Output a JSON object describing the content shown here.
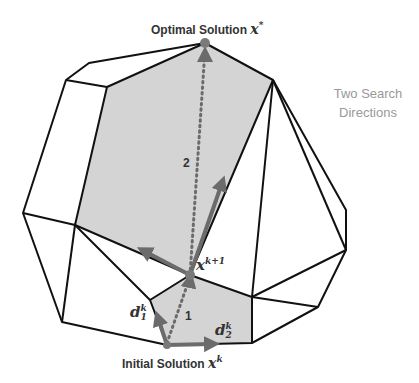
{
  "labels": {
    "optimal": "Optimal Solution",
    "optimal_var": "x",
    "optimal_sup": "*",
    "initial": "Initial Solution",
    "initial_var": "x",
    "initial_sup": "k",
    "next_var": "x",
    "next_sup": "k+1",
    "d1_var": "d",
    "d1_sup": "k",
    "d1_sub": "1",
    "d2_var": "d",
    "d2_sup": "k",
    "d2_sub": "2",
    "step1": "1",
    "step2": "2",
    "search_line1": "Two Search",
    "search_line2": "Directions"
  },
  "colors": {
    "edge": "#111111",
    "face_fill": "#d4d4d4",
    "arrow": "#6b6b6b",
    "point": "#7a7a7a",
    "text": "#333333",
    "annotation": "#999999"
  }
}
